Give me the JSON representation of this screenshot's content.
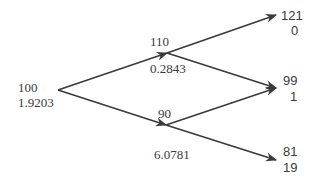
{
  "diagram": {
    "type": "binomial-tree",
    "line_color": "#3a3a3a",
    "root": {
      "value": "100",
      "sub": "1.9203"
    },
    "up": {
      "value": "110",
      "sub": "0.2843"
    },
    "down": {
      "value": "90",
      "sub": "6.0781"
    },
    "terminals": [
      {
        "value": "121",
        "sub": "0"
      },
      {
        "value": "99",
        "sub": "1"
      },
      {
        "value": "81",
        "sub": "19"
      }
    ]
  }
}
